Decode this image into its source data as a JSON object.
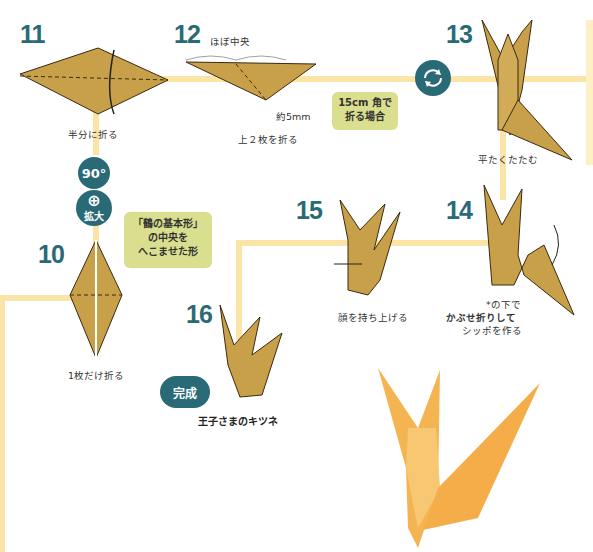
{
  "steps": {
    "s10": {
      "number": "10",
      "caption": "1枚だけ折る",
      "bubble": [
        "「鶴の基本形」",
        "の中央を",
        "へこませた形"
      ]
    },
    "s11": {
      "number": "11",
      "caption": "半分に折る"
    },
    "s12": {
      "number": "12",
      "caption": "上２枚を折る",
      "note_center": "ほぼ中央",
      "note_mm": "約5mm",
      "bubble": [
        "15cm 角で",
        "折る場合"
      ]
    },
    "s13": {
      "number": "13",
      "caption": "平たくたたむ"
    },
    "s14": {
      "number": "14",
      "caption_lines": [
        "*の下で",
        "かぶせ折りして",
        "シッポを作る"
      ]
    },
    "s15": {
      "number": "15",
      "caption": "顔を持ち上げる"
    },
    "s16": {
      "number": "16",
      "badge": "完成",
      "caption": "王子さまのキツネ"
    }
  },
  "icons": {
    "rotate90": "90°",
    "zoom_label": "拡大"
  },
  "colors": {
    "accent": "#2a6a77",
    "paper": "#c9a04a",
    "path": "#fbe5a6",
    "bubble": "#d9df8e",
    "photo_fox": "#f5b452"
  }
}
